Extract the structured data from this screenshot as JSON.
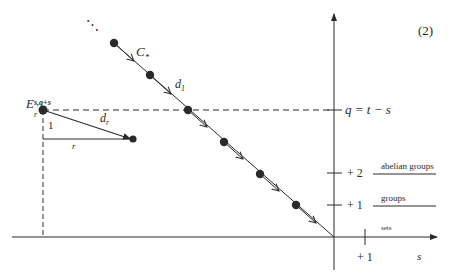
{
  "diagram": {
    "equation_number": "(2)",
    "chain_label": "C",
    "chain_label_sub": "*",
    "d1_label": "d",
    "d1_sub": "1",
    "dr_label": "d",
    "dr_sub": "r",
    "E_label": "E",
    "E_sub": "r",
    "E_sup": "s,q+s",
    "step_vertical_label": "1",
    "step_horizontal_label": "r",
    "q_axis_label": "q = t − s",
    "s_axis_label": "s",
    "ellipsis": "⋱",
    "y_ticks": [
      {
        "label": "+ 2",
        "level_label": "abelian groups"
      },
      {
        "label": "+ 1",
        "level_label": "groups"
      }
    ],
    "x_tick_label": "+ 1",
    "sets_label": "sets",
    "colors": {
      "ink": "#2a2a2a",
      "background": "#ffffff"
    }
  }
}
